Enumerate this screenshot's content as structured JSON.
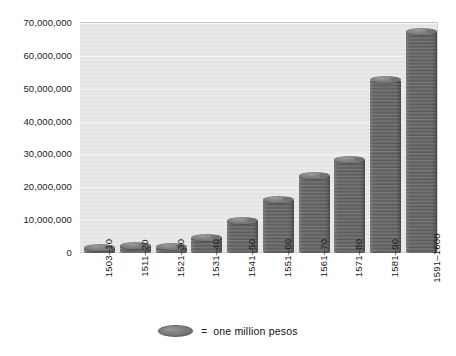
{
  "chart_data": {
    "type": "bar",
    "title": "",
    "subtitle": "",
    "xlabel": "",
    "ylabel": "",
    "categories": [
      "1503–10",
      "1511–20",
      "1521–30",
      "1531–40",
      "1541–50",
      "1551–60",
      "1561–70",
      "1571–80",
      "1581–90",
      "1591–1600"
    ],
    "values": [
      1800000,
      2400000,
      1900000,
      4800000,
      9900000,
      16300000,
      23600000,
      28500000,
      52800000,
      67500000
    ],
    "ylim": [
      0,
      70000000
    ],
    "y_ticks": [
      0,
      10000000,
      20000000,
      30000000,
      40000000,
      50000000,
      60000000,
      70000000
    ],
    "y_tick_labels": [
      "0",
      "10,000,000",
      "20,000,000",
      "30,000,000",
      "40,000,000",
      "50,000,000",
      "60,000,000",
      "70,000,000"
    ],
    "grid": true,
    "legend_position": "bottom",
    "legend": [
      {
        "marker": "coin-ellipse",
        "equals": "=",
        "label": "one million pesos"
      }
    ],
    "series": [
      {
        "name": "treasure imports (pesos)",
        "values": [
          1800000,
          2400000,
          1900000,
          4800000,
          9900000,
          16300000,
          23600000,
          28500000,
          52800000,
          67500000
        ]
      }
    ],
    "colors": {
      "bar": "#6a6a6a",
      "bar_highlight": "#9a9a9a",
      "plot_background": "#e9e9e7",
      "gridline": "#f6f6f4",
      "text": "#1a1a1a",
      "page_background": "#ffffff"
    }
  }
}
